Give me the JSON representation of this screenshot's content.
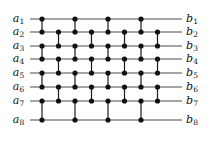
{
  "figure": {
    "type": "comparator-network",
    "title": "",
    "wire_count": 8,
    "column_count": 8,
    "colors": {
      "wire": "#4d4d4d",
      "comparator": "#1a1a1a",
      "node": "#111111",
      "label": "#111111",
      "background": "#ffffff"
    },
    "geometry": {
      "wire_x_start": 30,
      "wire_x_end": 182,
      "column_x": [
        42,
        58.5,
        75,
        91.5,
        108,
        124.5,
        141,
        157.5
      ],
      "row_y": [
        19,
        32,
        46,
        59,
        73,
        87,
        101,
        120
      ],
      "node_radius": 2.6,
      "wire_stroke": 1.1,
      "comparator_stroke": 1.2
    },
    "inputs": [
      {
        "id": "a1",
        "base": "a",
        "sub": "1",
        "x": 24,
        "y": 13
      },
      {
        "id": "a2",
        "base": "a",
        "sub": "2",
        "x": 24,
        "y": 26
      },
      {
        "id": "a3",
        "base": "a",
        "sub": "3",
        "x": 24,
        "y": 40
      },
      {
        "id": "a4",
        "base": "a",
        "sub": "4",
        "x": 24,
        "y": 53
      },
      {
        "id": "a5",
        "base": "a",
        "sub": "5",
        "x": 24,
        "y": 67
      },
      {
        "id": "a6",
        "base": "a",
        "sub": "6",
        "x": 24,
        "y": 81
      },
      {
        "id": "a7",
        "base": "a",
        "sub": "7",
        "x": 24,
        "y": 95
      },
      {
        "id": "a8",
        "base": "a",
        "sub": "8",
        "x": 24,
        "y": 114
      }
    ],
    "outputs": [
      {
        "id": "b1",
        "base": "b",
        "sub": "1",
        "x": 186,
        "y": 13
      },
      {
        "id": "b2",
        "base": "b",
        "sub": "2",
        "x": 186,
        "y": 26
      },
      {
        "id": "b3",
        "base": "b",
        "sub": "3",
        "x": 186,
        "y": 40
      },
      {
        "id": "b4",
        "base": "b",
        "sub": "4",
        "x": 186,
        "y": 53
      },
      {
        "id": "b5",
        "base": "b",
        "sub": "5",
        "x": 186,
        "y": 67
      },
      {
        "id": "b6",
        "base": "b",
        "sub": "6",
        "x": 186,
        "y": 81
      },
      {
        "id": "b7",
        "base": "b",
        "sub": "7",
        "x": 186,
        "y": 95
      },
      {
        "id": "b8",
        "base": "b",
        "sub": "8",
        "x": 186,
        "y": 114
      }
    ],
    "comparators": [
      {
        "column": 1,
        "top_wire": 1,
        "bottom_wire": 2
      },
      {
        "column": 1,
        "top_wire": 3,
        "bottom_wire": 4
      },
      {
        "column": 1,
        "top_wire": 5,
        "bottom_wire": 6
      },
      {
        "column": 1,
        "top_wire": 7,
        "bottom_wire": 8
      },
      {
        "column": 2,
        "top_wire": 2,
        "bottom_wire": 3
      },
      {
        "column": 2,
        "top_wire": 4,
        "bottom_wire": 5
      },
      {
        "column": 2,
        "top_wire": 6,
        "bottom_wire": 7
      },
      {
        "column": 3,
        "top_wire": 1,
        "bottom_wire": 2
      },
      {
        "column": 3,
        "top_wire": 3,
        "bottom_wire": 4
      },
      {
        "column": 3,
        "top_wire": 5,
        "bottom_wire": 6
      },
      {
        "column": 3,
        "top_wire": 7,
        "bottom_wire": 8
      },
      {
        "column": 4,
        "top_wire": 2,
        "bottom_wire": 3
      },
      {
        "column": 4,
        "top_wire": 4,
        "bottom_wire": 5
      },
      {
        "column": 4,
        "top_wire": 6,
        "bottom_wire": 7
      },
      {
        "column": 5,
        "top_wire": 1,
        "bottom_wire": 2
      },
      {
        "column": 5,
        "top_wire": 3,
        "bottom_wire": 4
      },
      {
        "column": 5,
        "top_wire": 5,
        "bottom_wire": 6
      },
      {
        "column": 5,
        "top_wire": 7,
        "bottom_wire": 8
      },
      {
        "column": 6,
        "top_wire": 2,
        "bottom_wire": 3
      },
      {
        "column": 6,
        "top_wire": 4,
        "bottom_wire": 5
      },
      {
        "column": 6,
        "top_wire": 6,
        "bottom_wire": 7
      },
      {
        "column": 7,
        "top_wire": 1,
        "bottom_wire": 2
      },
      {
        "column": 7,
        "top_wire": 3,
        "bottom_wire": 4
      },
      {
        "column": 7,
        "top_wire": 5,
        "bottom_wire": 6
      },
      {
        "column": 7,
        "top_wire": 7,
        "bottom_wire": 8
      },
      {
        "column": 8,
        "top_wire": 2,
        "bottom_wire": 3
      },
      {
        "column": 8,
        "top_wire": 4,
        "bottom_wire": 5
      },
      {
        "column": 8,
        "top_wire": 6,
        "bottom_wire": 7
      }
    ]
  }
}
